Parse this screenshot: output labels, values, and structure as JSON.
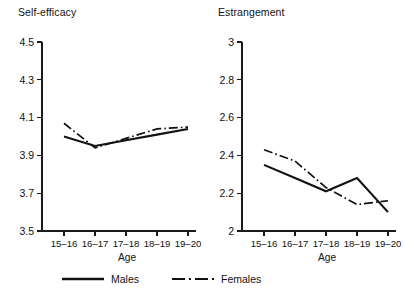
{
  "figure": {
    "background_color": "#ffffff",
    "line_color": "#111111"
  },
  "legend": {
    "position": "bottom-center",
    "entries": [
      {
        "label": "Males",
        "style": "solid",
        "swatch_name": "legend-swatch-solid"
      },
      {
        "label": "Females",
        "style": "dash-dot",
        "swatch_name": "legend-swatch-dashdot"
      }
    ]
  },
  "chart_data": [
    {
      "type": "line",
      "panel": "left",
      "title": "Self-efficacy",
      "xlabel": "Age",
      "ylabel": "",
      "categories": [
        "15–16",
        "16–17",
        "17–18",
        "18–19",
        "19–20"
      ],
      "yticks": [
        "4.5",
        "4.3",
        "4.1",
        "3.9",
        "3.7",
        "3.5"
      ],
      "ytick_values": [
        4.5,
        4.3,
        4.1,
        3.9,
        3.7,
        3.5
      ],
      "ylim": [
        3.5,
        4.5
      ],
      "grid": false,
      "series": [
        {
          "name": "Males",
          "style": "solid",
          "values": [
            4.0,
            3.95,
            3.98,
            4.01,
            4.04
          ]
        },
        {
          "name": "Females",
          "style": "dash-dot",
          "values": [
            4.07,
            3.94,
            3.99,
            4.04,
            4.05
          ]
        }
      ]
    },
    {
      "type": "line",
      "panel": "right",
      "title": "Estrangement",
      "xlabel": "Age",
      "ylabel": "",
      "categories": [
        "15–16",
        "16–17",
        "17–18",
        "18–19",
        "19–20"
      ],
      "yticks": [
        "3",
        "2.8",
        "2.6",
        "2.4",
        "2.2",
        "2"
      ],
      "ytick_values": [
        3.0,
        2.8,
        2.6,
        2.4,
        2.2,
        2.0
      ],
      "ylim": [
        2.0,
        3.0
      ],
      "grid": false,
      "series": [
        {
          "name": "Males",
          "style": "solid",
          "values": [
            2.35,
            2.28,
            2.21,
            2.28,
            2.1
          ]
        },
        {
          "name": "Females",
          "style": "dash-dot",
          "values": [
            2.43,
            2.37,
            2.23,
            2.14,
            2.16
          ]
        }
      ]
    }
  ]
}
